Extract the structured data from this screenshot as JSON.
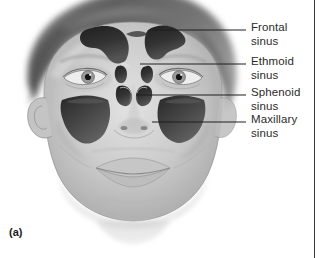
{
  "figure": {
    "caption": "(a)",
    "background_color": "#ffffff",
    "text_color": "#2b2b2b",
    "leader_line_color": "#1f1f1f",
    "edge_rule_color": "#3a3a3a"
  },
  "labels": [
    {
      "id": "frontal-sinus",
      "line1": "Frontal",
      "line2": "sinus",
      "text_x": 251,
      "text_y": 21,
      "leader": {
        "x1": 152,
        "y1": 30,
        "x2": 246,
        "y2": 30
      }
    },
    {
      "id": "ethmoid-sinus",
      "line1": "Ethmoid",
      "line2": "sinus",
      "text_x": 251,
      "text_y": 55,
      "leader": {
        "x1": 140,
        "y1": 64,
        "x2": 246,
        "y2": 64
      }
    },
    {
      "id": "sphenoid-sinus",
      "line1": "Sphenoid",
      "line2": "sinus",
      "text_x": 251,
      "text_y": 86,
      "leader": {
        "x1": 136,
        "y1": 95,
        "x2": 246,
        "y2": 95
      }
    },
    {
      "id": "maxillary-sinus",
      "line1": "Maxillary",
      "line2": "sinus",
      "text_x": 251,
      "text_y": 113,
      "leader": {
        "x1": 152,
        "y1": 122,
        "x2": 246,
        "y2": 122
      }
    }
  ],
  "anatomy": {
    "hair_color": "#6d6d6d",
    "skin_base_color": "#cfcfcf",
    "skin_shadow_color": "#a8a8a8",
    "sinus_cavity_color": "#2a2a2a",
    "sinus_cavity_mid_color": "#4a4a4a",
    "outline_color": "#7a7a7a",
    "structures": [
      "frontal sinus left",
      "frontal sinus right",
      "ethmoid sinus left",
      "ethmoid sinus right",
      "sphenoid sinus left",
      "sphenoid sinus right",
      "maxillary sinus left",
      "maxillary sinus right",
      "eye left",
      "eye right",
      "nose",
      "lips",
      "ear",
      "hair"
    ]
  },
  "edge_rule": {
    "x": 314
  }
}
